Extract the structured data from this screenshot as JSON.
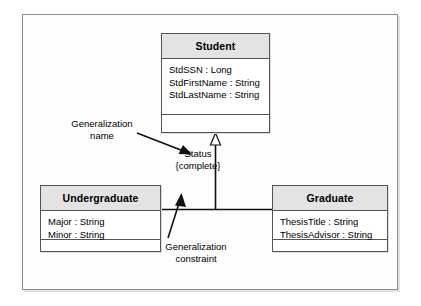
{
  "diagram": {
    "type": "uml-class-generalization",
    "classes": [
      {
        "id": "student",
        "name": "Student",
        "attributes": [
          "StdSSN : Long",
          "StdFirstName : String",
          "StdLastName : String"
        ],
        "operations": []
      },
      {
        "id": "undergraduate",
        "name": "Undergraduate",
        "attributes": [
          "Major : String",
          "Minor : String"
        ],
        "operations": []
      },
      {
        "id": "graduate",
        "name": "Graduate",
        "attributes": [
          "ThesisTitle : String",
          "ThesisAdvisor : String"
        ],
        "operations": []
      }
    ],
    "generalization": {
      "name": "Status",
      "constraint": "{complete}",
      "superclass": "Student",
      "subclasses": [
        "Undergraduate",
        "Graduate"
      ]
    },
    "annotations": [
      {
        "id": "generalization-name",
        "line1": "Generalization",
        "line2": "name"
      },
      {
        "id": "generalization-constraint",
        "line1": "Generalization",
        "line2": "constraint"
      }
    ],
    "colors": {
      "frame_border": "#8d8d8d",
      "class_border": "#555555",
      "header_fill": "#e3e3e3",
      "body_fill": "#ffffff",
      "line": "#000000",
      "page_background": "#ffffff"
    }
  }
}
